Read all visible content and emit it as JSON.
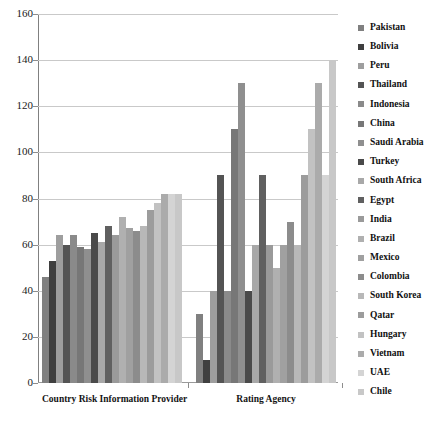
{
  "chart_data": {
    "type": "bar",
    "title": "",
    "subtitle": "",
    "xlabel": "",
    "ylabel": "",
    "ylim": [
      0,
      160
    ],
    "ytick_values": [
      160,
      140,
      120,
      100,
      80,
      60,
      40,
      20,
      0
    ],
    "ytick_labels": [
      "160",
      "140",
      "120",
      "100",
      "80",
      "60",
      "40",
      "20",
      "0"
    ],
    "grid": true,
    "legend_position": "right",
    "categories": [
      "Country Risk Information Provider",
      "Rating Agency"
    ],
    "series": [
      {
        "name": "Pakistan",
        "color": "#808080",
        "values": [
          46,
          30
        ]
      },
      {
        "name": "Bolivia",
        "color": "#3f3f3f",
        "values": [
          53,
          10
        ]
      },
      {
        "name": "Peru",
        "color": "#9e9e9e",
        "values": [
          64,
          40
        ]
      },
      {
        "name": "Thailand",
        "color": "#545454",
        "values": [
          60,
          90
        ]
      },
      {
        "name": "Indonesia",
        "color": "#8a8a8a",
        "values": [
          64,
          40
        ]
      },
      {
        "name": "China",
        "color": "#777777",
        "values": [
          59,
          110
        ]
      },
      {
        "name": "Saudi Arabia",
        "color": "#8f8f8f",
        "values": [
          58,
          130
        ]
      },
      {
        "name": "Turkey",
        "color": "#4a4a4a",
        "values": [
          65,
          40
        ]
      },
      {
        "name": "South Africa",
        "color": "#a8a8a8",
        "values": [
          61,
          60
        ]
      },
      {
        "name": "Egypt",
        "color": "#606060",
        "values": [
          68,
          90
        ]
      },
      {
        "name": "India",
        "color": "#9a9a9a",
        "values": [
          64,
          60
        ]
      },
      {
        "name": "Brazil",
        "color": "#b0b0b0",
        "values": [
          72,
          50
        ]
      },
      {
        "name": "Mexico",
        "color": "#a0a0a0",
        "values": [
          67,
          60
        ]
      },
      {
        "name": "Colombia",
        "color": "#8c8c8c",
        "values": [
          66,
          70
        ]
      },
      {
        "name": "South Korea",
        "color": "#b8b8b8",
        "values": [
          68,
          60
        ]
      },
      {
        "name": "Qatar",
        "color": "#9c9c9c",
        "values": [
          75,
          90
        ]
      },
      {
        "name": "Hungary",
        "color": "#c2c2c2",
        "values": [
          78,
          110
        ]
      },
      {
        "name": "Vietnam",
        "color": "#ababab",
        "values": [
          82,
          130
        ]
      },
      {
        "name": "UAE",
        "color": "#d4d4d4",
        "values": [
          82,
          90
        ]
      },
      {
        "name": "Chile",
        "color": "#c8c8c8",
        "values": [
          82,
          140
        ]
      }
    ]
  },
  "axis": {
    "tick_0": "0",
    "tick_20": "20",
    "tick_40": "40",
    "tick_60": "60",
    "tick_80": "80",
    "tick_100": "100",
    "tick_120": "120",
    "tick_140": "140",
    "tick_160": "160"
  },
  "groups": {
    "g0_label": "Country Risk Information Provider",
    "g1_label": "Rating Agency"
  }
}
